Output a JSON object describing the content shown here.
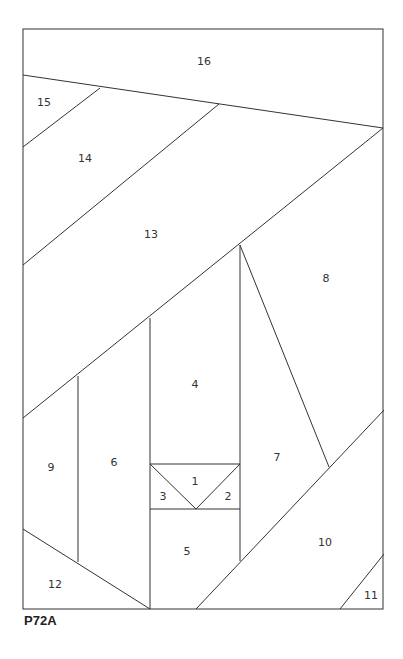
{
  "diagram": {
    "caption": "P72A",
    "type": "foundation-paper-piecing-pattern",
    "pieces": [
      {
        "id": "1",
        "x": 195,
        "y": 482
      },
      {
        "id": "2",
        "x": 228,
        "y": 497
      },
      {
        "id": "3",
        "x": 163,
        "y": 497
      },
      {
        "id": "4",
        "x": 195,
        "y": 385
      },
      {
        "id": "5",
        "x": 187,
        "y": 552
      },
      {
        "id": "6",
        "x": 114,
        "y": 463
      },
      {
        "id": "7",
        "x": 277,
        "y": 458
      },
      {
        "id": "8",
        "x": 326,
        "y": 279
      },
      {
        "id": "9",
        "x": 51,
        "y": 468
      },
      {
        "id": "10",
        "x": 325,
        "y": 543
      },
      {
        "id": "11",
        "x": 371,
        "y": 596
      },
      {
        "id": "12",
        "x": 55,
        "y": 585
      },
      {
        "id": "13",
        "x": 151,
        "y": 235
      },
      {
        "id": "14",
        "x": 85,
        "y": 159
      },
      {
        "id": "15",
        "x": 44,
        "y": 103
      },
      {
        "id": "16",
        "x": 204,
        "y": 62
      }
    ],
    "line_color": "#333333"
  }
}
